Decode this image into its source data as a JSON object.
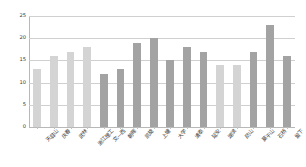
{
  "chart_data": {
    "type": "bar",
    "title": "",
    "subtitle": "",
    "xlabel": "",
    "ylabel": "",
    "ylim": [
      0,
      25
    ],
    "ytick_values": [
      0,
      5,
      10,
      15,
      20,
      25
    ],
    "ytick_labels": [
      "0",
      "5",
      "10",
      "15",
      "20",
      "25"
    ],
    "grid": true,
    "legend": "none",
    "categories": [
      "天目山",
      "庆春",
      "武林",
      "浙江理工",
      "文一西",
      "朝晖",
      "凯旋",
      "上塘",
      "大学",
      "清泰",
      "延安",
      "湖滨",
      "凤山",
      "莫干山",
      "石桥",
      "留下"
    ],
    "values": [
      13,
      16,
      17,
      18,
      12,
      13,
      19,
      20,
      15,
      18,
      17,
      14,
      14,
      17,
      23,
      16
    ],
    "bar_colors": [
      "#d4d4d4",
      "#d4d4d4",
      "#d4d4d4",
      "#d4d4d4",
      "#a3a3a3",
      "#a3a3a3",
      "#a3a3a3",
      "#a3a3a3",
      "#a3a3a3",
      "#a3a3a3",
      "#a3a3a3",
      "#d4d4d4",
      "#d4d4d4",
      "#a3a3a3",
      "#a3a3a3",
      "#a3a3a3"
    ],
    "colors": {
      "light_bar": "#d4d4d4",
      "dark_bar": "#a3a3a3",
      "gridline": "#d0d0d0",
      "axis": "#b8b8b8",
      "text": "#3a3a3a",
      "background": "#ffffff"
    }
  }
}
